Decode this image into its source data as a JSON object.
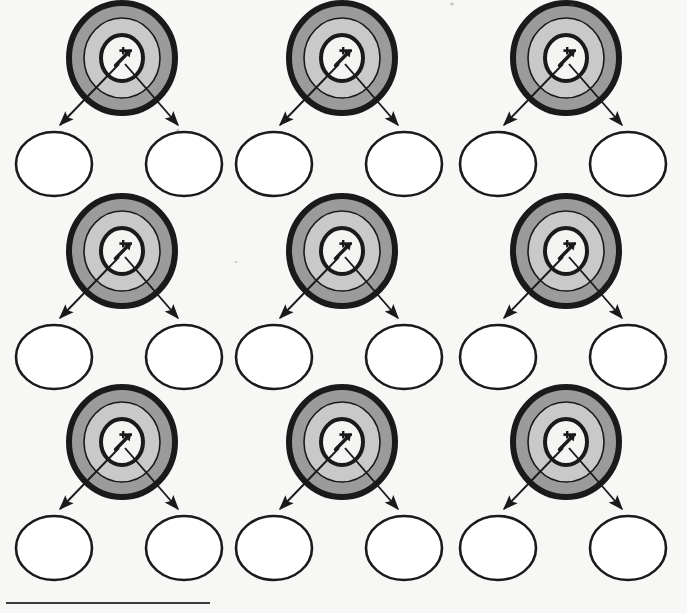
{
  "page": {
    "background_color": "#f7f7f5",
    "width": 687,
    "height": 613,
    "grid_rows": 3,
    "grid_cols": 3,
    "unit_count": 9
  },
  "styles": {
    "stroke_color": "#1a1a1a",
    "ring_outer_band": "#9b9b9b",
    "ring_inner_band": "#c9c9c9",
    "ring_bullseye": "#f2f2f0",
    "child_circle_fill": "#ffffff",
    "arrow_color": "#1a1a1a",
    "rule_color": "#3a3a3a"
  },
  "unit_template": {
    "target_name": "bullseye-target",
    "target": {
      "center_x": 0,
      "center_y": -58,
      "outer_rx": 56,
      "outer_ry": 58,
      "outer_stroke_width": 6,
      "band2_rx": 40,
      "band2_ry": 42,
      "band3_rx": 24,
      "band3_ry": 26,
      "bullseye_stroke_width": 4
    },
    "center_glyph": {
      "name": "arrow-up-right-glyph",
      "direction": "up-right"
    },
    "children": [
      {
        "name": "child-circle-left",
        "center_x": -68,
        "center_y": 48,
        "rx": 38,
        "ry": 32
      },
      {
        "name": "child-circle-right",
        "center_x": 62,
        "center_y": 48,
        "rx": 38,
        "ry": 32
      }
    ],
    "connectors": [
      {
        "name": "connector-arrow-left",
        "from": "target-center",
        "to": "child-circle-left",
        "arrowhead": true
      },
      {
        "name": "connector-arrow-right",
        "from": "target-center",
        "to": "child-circle-right",
        "arrowhead": true
      }
    ]
  },
  "units": [
    {
      "id": "unit-r1c1",
      "row": 1,
      "col": 1,
      "origin_x": 122,
      "origin_y": 116
    },
    {
      "id": "unit-r1c2",
      "row": 1,
      "col": 2,
      "origin_x": 342,
      "origin_y": 116
    },
    {
      "id": "unit-r1c3",
      "row": 1,
      "col": 3,
      "origin_x": 566,
      "origin_y": 116
    },
    {
      "id": "unit-r2c1",
      "row": 2,
      "col": 1,
      "origin_x": 122,
      "origin_y": 309
    },
    {
      "id": "unit-r2c2",
      "row": 2,
      "col": 2,
      "origin_x": 342,
      "origin_y": 309
    },
    {
      "id": "unit-r2c3",
      "row": 2,
      "col": 3,
      "origin_x": 566,
      "origin_y": 309
    },
    {
      "id": "unit-r3c1",
      "row": 3,
      "col": 1,
      "origin_x": 122,
      "origin_y": 500
    },
    {
      "id": "unit-r3c2",
      "row": 3,
      "col": 2,
      "origin_x": 342,
      "origin_y": 500
    },
    {
      "id": "unit-r3c3",
      "row": 3,
      "col": 3,
      "origin_x": 566,
      "origin_y": 500
    }
  ],
  "bottom_rule": {
    "name": "bottom-horizontal-rule",
    "x1": 6,
    "x2": 210,
    "y": 603,
    "thickness": 2
  },
  "specks": [
    {
      "x": 452,
      "y": 4,
      "rx": 2.0,
      "ry": 1.4
    },
    {
      "x": 572,
      "y": 5,
      "rx": 2.6,
      "ry": 2.2
    },
    {
      "x": 178,
      "y": 130,
      "rx": 1.6,
      "ry": 1.2
    },
    {
      "x": 236,
      "y": 262,
      "rx": 1.4,
      "ry": 1.1
    }
  ]
}
